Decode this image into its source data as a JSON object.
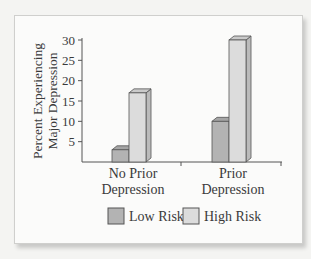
{
  "chart_data": {
    "type": "bar",
    "style": "3d-grouped",
    "title": "",
    "xlabel": "",
    "ylabel": "Percent Experiencing Major Depression",
    "ylabel_lines": [
      "Percent Experiencing",
      "Major Depression"
    ],
    "categories": [
      "No Prior Depression",
      "Prior Depression"
    ],
    "category_lines": [
      [
        "No Prior",
        "Depression"
      ],
      [
        "Prior",
        "Depression"
      ]
    ],
    "series": [
      {
        "name": "Low Risk",
        "values": [
          3,
          10
        ],
        "color": "#b3b3b3"
      },
      {
        "name": "High Risk",
        "values": [
          17,
          30
        ],
        "color": "#dcdcdc"
      }
    ],
    "yticks": [
      5,
      10,
      15,
      20,
      25,
      30
    ],
    "ylim": [
      0,
      30
    ],
    "grid": false,
    "legend_position": "bottom"
  },
  "legend": {
    "items": [
      {
        "label": "Low Risk",
        "color": "#b3b3b3"
      },
      {
        "label": "High Risk",
        "color": "#dcdcdc"
      }
    ]
  }
}
